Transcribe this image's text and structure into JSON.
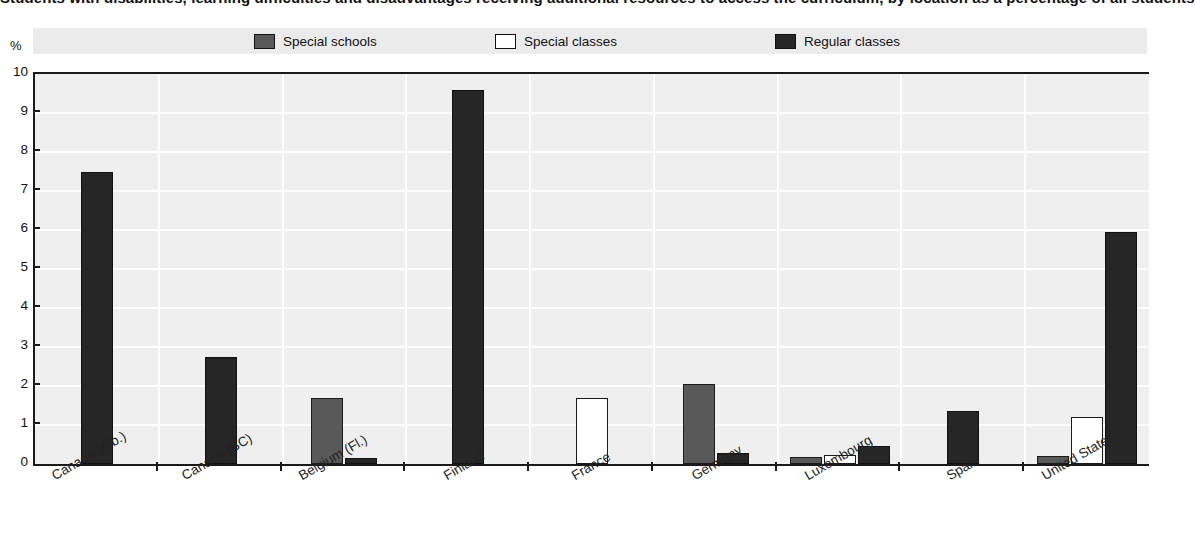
{
  "chart_data": {
    "type": "bar",
    "title": "Students with disabilities, learning difficulties and disadvantages receiving additional resources to access the curriculum, by location as a percentage of all students",
    "xlabel": "",
    "ylabel": "%",
    "ylim": [
      0,
      10
    ],
    "ytick_labels": [
      "10",
      "9",
      "8",
      "7",
      "6",
      "5",
      "4",
      "3",
      "2",
      "1",
      "0"
    ],
    "ytick_values": [
      10,
      9,
      8,
      7,
      6,
      5,
      4,
      3,
      2,
      1,
      0
    ],
    "grid": "horizontal-and-vertical white gridlines on light grey panel",
    "legend_position": "top",
    "categories": [
      "Canada (Alb.)",
      "Canada (BC)",
      "Belgium (Fl.)",
      "Finland",
      "France",
      "Germany",
      "Luxembourg",
      "Spain",
      "United States"
    ],
    "series": [
      {
        "name": "Special schools",
        "color": "#595959",
        "values": [
          null,
          null,
          1.7,
          null,
          null,
          2.05,
          0.18,
          null,
          0.2
        ]
      },
      {
        "name": "Special classes",
        "color": "#ffffff",
        "values": [
          null,
          null,
          null,
          null,
          1.7,
          null,
          0.22,
          null,
          1.2
        ]
      },
      {
        "name": "Regular classes",
        "color": "#262626",
        "values": [
          7.5,
          2.75,
          0.15,
          9.6,
          null,
          0.28,
          0.45,
          1.35,
          5.95
        ]
      }
    ]
  },
  "legend": {
    "items": [
      {
        "label": "Special schools",
        "color": "#595959"
      },
      {
        "label": "Special classes",
        "color": "#ffffff"
      },
      {
        "label": "Regular classes",
        "color": "#262626"
      }
    ]
  },
  "axis": {
    "y_unit": "%"
  }
}
